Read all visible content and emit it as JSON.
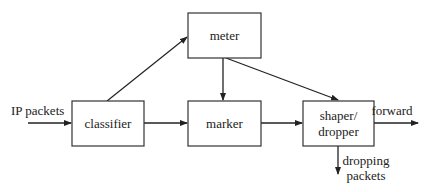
{
  "diagram": {
    "nodes": {
      "meter": {
        "label": "meter"
      },
      "classifier": {
        "label": "classifier"
      },
      "marker": {
        "label": "marker"
      },
      "shaper": {
        "label_line1": "shaper/",
        "label_line2": "dropper"
      }
    },
    "edge_labels": {
      "input": "IP packets",
      "output": "forward",
      "drop_line1": "dropping",
      "drop_line2": "packets"
    },
    "edges": [
      {
        "from": "input",
        "to": "classifier"
      },
      {
        "from": "classifier",
        "to": "meter"
      },
      {
        "from": "classifier",
        "to": "marker"
      },
      {
        "from": "meter",
        "to": "marker"
      },
      {
        "from": "meter",
        "to": "shaper"
      },
      {
        "from": "marker",
        "to": "shaper"
      },
      {
        "from": "shaper",
        "to": "output"
      },
      {
        "from": "shaper",
        "to": "drop"
      }
    ]
  }
}
